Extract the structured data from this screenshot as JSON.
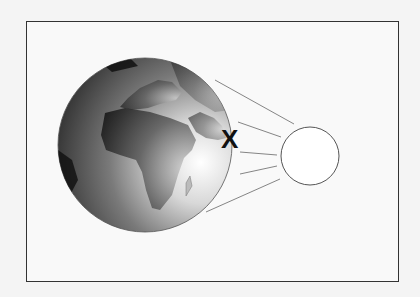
{
  "diagram": {
    "marker_label": "X",
    "earth": {
      "label": "earth-globe",
      "center": [
        145,
        145
      ],
      "radius": 87
    },
    "sun": {
      "label": "sun-circle",
      "center": [
        310,
        156
      ],
      "radius": 29
    },
    "rays": 5,
    "colors": {
      "frame": "#333333",
      "earth_dark": "#1e1e1e",
      "earth_light": "#ffffff",
      "rays": "#777777"
    }
  }
}
